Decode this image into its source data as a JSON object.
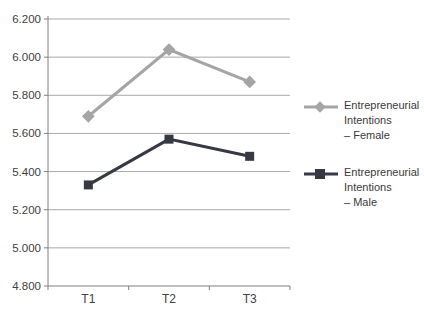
{
  "chart_data": {
    "type": "line",
    "title": "",
    "xlabel": "",
    "ylabel": "",
    "categories": [
      "T1",
      "T2",
      "T3"
    ],
    "series": [
      {
        "name": "Entrepreneurial Intentions – Female",
        "legend_lines": [
          "Entrepreneurial",
          "Intentions",
          "– Female"
        ],
        "values": [
          5.69,
          6.04,
          5.87
        ],
        "color": "#a5a5a5",
        "marker": "diamond",
        "line_width": 3
      },
      {
        "name": "Entrepreneurial Intentions – Male",
        "legend_lines": [
          "Entrepreneurial",
          "Intentions",
          "– Male"
        ],
        "values": [
          5.33,
          5.57,
          5.48
        ],
        "color": "#363943",
        "marker": "square",
        "line_width": 3
      }
    ],
    "ylim": [
      4.8,
      6.2
    ],
    "ytick_step": 0.2,
    "ytick_decimals": 3,
    "ytick_labels": [
      "4.800",
      "5.000",
      "5.200",
      "5.400",
      "5.600",
      "5.800",
      "6.000",
      "6.200"
    ],
    "grid": true,
    "legend_position": "right",
    "axis_color": "#808080",
    "grid_color": "#a9a9a9",
    "text_color": "#404040"
  }
}
